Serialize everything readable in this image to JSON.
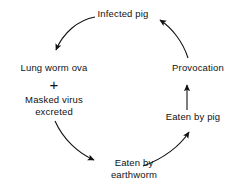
{
  "diagram": {
    "type": "cycle-diagram",
    "stroke_color": "#111111",
    "background_color": "#ffffff",
    "nodes": [
      {
        "id": "infected-pig",
        "lines": [
          "Infected pig"
        ],
        "position": "top"
      },
      {
        "id": "lung-worm-ova",
        "lines": [
          "Lung worm ova"
        ],
        "position": "left-upper"
      },
      {
        "id": "masked-virus-excreted",
        "lines": [
          "Masked virus",
          "excreted"
        ],
        "position": "left-lower"
      },
      {
        "id": "eaten-by-earthworm",
        "lines": [
          "Eaten by",
          "earthworm"
        ],
        "position": "bottom"
      },
      {
        "id": "eaten-by-pig",
        "lines": [
          "Eaten by pig"
        ],
        "position": "right-lower"
      },
      {
        "id": "provocation",
        "lines": [
          "Provocation"
        ],
        "position": "right-upper"
      }
    ],
    "plus_symbol": "+",
    "edges": [
      {
        "id": "infected-pig-to-lung-worm-ova",
        "from": "infected-pig",
        "to": "lung-worm-ova",
        "style": "curved-arrow"
      },
      {
        "id": "masked-virus-to-earthworm",
        "from": "masked-virus-excreted",
        "to": "eaten-by-earthworm",
        "style": "curved-arrow"
      },
      {
        "id": "earthworm-to-eaten-by-pig",
        "from": "eaten-by-earthworm",
        "to": "eaten-by-pig",
        "style": "curved-arrow"
      },
      {
        "id": "eaten-by-pig-to-provocation",
        "from": "eaten-by-pig",
        "to": "provocation",
        "style": "straight-arrow"
      },
      {
        "id": "provocation-to-infected-pig",
        "from": "provocation",
        "to": "infected-pig",
        "style": "curved-arrow"
      }
    ]
  }
}
